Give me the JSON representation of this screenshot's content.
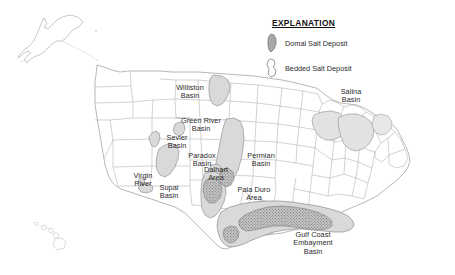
{
  "map": {
    "title": "Salt deposits of the United States",
    "background_color": "#ffffff",
    "outline_color": "#8a8a8a",
    "bedded_fill": "#d9d9d9",
    "domal_fill": "#a8a8a8",
    "label_color": "#2b2b2b"
  },
  "legend": {
    "title": "EXPLANATION",
    "items": [
      {
        "label": "Domal Salt Deposit",
        "swatch": "domal-salt-swatch",
        "fill": "#a8a8a8"
      },
      {
        "label": "Bedded Salt Deposit",
        "swatch": "bedded-salt-swatch",
        "fill": "#ffffff"
      }
    ]
  },
  "labels": [
    {
      "id": "williston-basin",
      "text": "Williston\nBasin",
      "x": 166,
      "y": 84,
      "w": 48
    },
    {
      "id": "salina-basin",
      "text": "Salina\nBasin",
      "x": 330,
      "y": 88,
      "w": 42
    },
    {
      "id": "green-river-basin",
      "text": "Green River\nBasin",
      "x": 173,
      "y": 117,
      "w": 56
    },
    {
      "id": "sevier-basin",
      "text": "Sevier\nBasin",
      "x": 159,
      "y": 134,
      "w": 36
    },
    {
      "id": "paradox-basin",
      "text": "Paradox\nBasin",
      "x": 180,
      "y": 152,
      "w": 44
    },
    {
      "id": "dalhart-area",
      "text": "Dalhart\nArea",
      "x": 197,
      "y": 166,
      "w": 38
    },
    {
      "id": "permian-basin",
      "text": "Permian\nBasin",
      "x": 239,
      "y": 152,
      "w": 44
    },
    {
      "id": "virgin-river",
      "text": "Virgin\nRiver",
      "x": 126,
      "y": 172,
      "w": 34
    },
    {
      "id": "supai-basin",
      "text": "Supai\nBasin",
      "x": 152,
      "y": 184,
      "w": 34
    },
    {
      "id": "palo-duro-area",
      "text": "Pala Duro\nArea",
      "x": 228,
      "y": 186,
      "w": 52
    },
    {
      "id": "gulf-coast-embayment-basin",
      "text": "Gulf Coast\nEmbayment\nBasin",
      "x": 281,
      "y": 231,
      "w": 64
    }
  ]
}
